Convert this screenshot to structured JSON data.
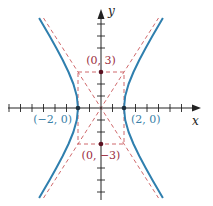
{
  "figure": {
    "type": "hyperbola-graph",
    "equation_implied": "x^2/4 - y^2/9 = 1",
    "colors": {
      "hyperbola": "#2f7fae",
      "guides": "#c9585b",
      "vertex_label": "#3a7fa8",
      "covertex_label": "#9b2c3e",
      "axis": "#222222"
    },
    "axes": {
      "x_label": "x",
      "y_label": "y",
      "x_ticks": [
        -8,
        -7,
        -6,
        -5,
        -4,
        -3,
        -2,
        -1,
        1,
        2,
        3,
        4,
        5,
        6,
        7,
        8
      ],
      "y_ticks": [
        -7,
        -6,
        -5,
        -4,
        -3,
        -2,
        -1,
        1,
        2,
        3,
        4,
        5,
        6,
        7
      ]
    },
    "points": {
      "left_vertex": "(−2, 0)",
      "right_vertex": "(2, 0)",
      "top_covertex": "(0, 3)",
      "bottom_covertex": "(0, −3)"
    },
    "guides": {
      "rectangle": {
        "x_min": -2,
        "x_max": 2,
        "y_min": -3,
        "y_max": 3
      },
      "asymptotes": [
        "y = 3x/2",
        "y = -3x/2"
      ]
    }
  }
}
